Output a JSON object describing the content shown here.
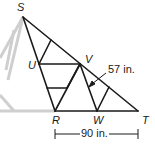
{
  "diagram": {
    "type": "roof truss (similar triangles)",
    "colors": {
      "line": "#1a1a1a",
      "faded": "#cfcfcf",
      "background": "#ffffff"
    },
    "points": {
      "S": {
        "label": "S",
        "x": 23,
        "y": 17
      },
      "U": {
        "label": "U",
        "x": 39,
        "y": 64
      },
      "V": {
        "label": "V",
        "x": 80,
        "y": 64
      },
      "R": {
        "label": "R",
        "x": 55,
        "y": 111
      },
      "W": {
        "label": "W",
        "x": 97,
        "y": 111
      },
      "T": {
        "label": "T",
        "x": 138,
        "y": 111
      }
    },
    "measurements": {
      "diagonal": {
        "text": "57 in.",
        "segment": "VW"
      },
      "base": {
        "text": "90 in.",
        "segment": "RT"
      }
    }
  }
}
